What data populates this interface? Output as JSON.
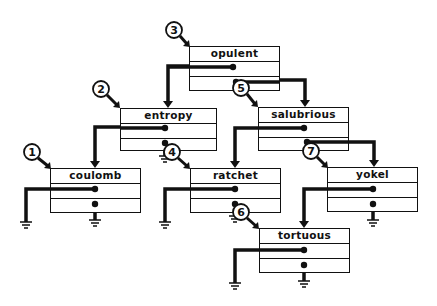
{
  "diagram": {
    "type": "binary-search-tree-linked-nodes",
    "nodes": [
      {
        "id": "coulomb",
        "label": "coulomb",
        "order": "1",
        "x": 50,
        "y": 168
      },
      {
        "id": "entropy",
        "label": "entropy",
        "order": "2",
        "x": 120,
        "y": 108
      },
      {
        "id": "opulent",
        "label": "opulent",
        "order": "3",
        "x": 189,
        "y": 46
      },
      {
        "id": "ratchet",
        "label": "ratchet",
        "order": "4",
        "x": 190,
        "y": 168
      },
      {
        "id": "salubrious",
        "label": "salubrious",
        "order": "5",
        "x": 258,
        "y": 107
      },
      {
        "id": "tortuous",
        "label": "tortuous",
        "order": "6",
        "x": 259,
        "y": 228
      },
      {
        "id": "yokel",
        "label": "yokel",
        "order": "7",
        "x": 327,
        "y": 167
      }
    ],
    "edges": [
      {
        "from": "opulent",
        "to": "entropy",
        "side": "left"
      },
      {
        "from": "opulent",
        "to": "salubrious",
        "side": "right"
      },
      {
        "from": "entropy",
        "to": "coulomb",
        "side": "left"
      },
      {
        "from": "entropy",
        "to": "ratchet",
        "side": "right"
      },
      {
        "from": "salubrious",
        "to": "ratchet",
        "side": "left"
      },
      {
        "from": "salubrious",
        "to": "yokel",
        "side": "right"
      },
      {
        "from": "ratchet",
        "to": "tortuous",
        "side": "right"
      },
      {
        "from": "yokel",
        "to": "tortuous",
        "side": "left"
      }
    ],
    "colors": {
      "ink": "#111111",
      "background": "#ffffff"
    }
  },
  "labels": {
    "coulomb": "coulomb",
    "entropy": "entropy",
    "opulent": "opulent",
    "ratchet": "ratchet",
    "salubrious": "salubrious",
    "tortuous": "tortuous",
    "yokel": "yokel"
  },
  "callouts": {
    "c1": "1",
    "c2": "2",
    "c3": "3",
    "c4": "4",
    "c5": "5",
    "c6": "6",
    "c7": "7"
  }
}
